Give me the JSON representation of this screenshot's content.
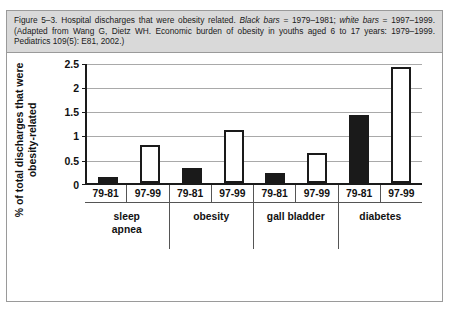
{
  "caption": {
    "part1": "Figure 5–3. Hospital discharges that were obesity related. ",
    "italic1": "Black bars",
    "part2": " = 1979–1981; ",
    "italic2": "white bars",
    "part3": " = 1997–1999. (Adapted from Wang G, Dietz WH. Economic burden of obesity in youths aged 6 to 17 years: 1979–1999. Pediatrics 109(5): E81, 2002.)"
  },
  "chart_data": {
    "type": "bar",
    "title": "",
    "xlabel": "",
    "ylabel": "% of total discharges that were obesity-related",
    "ylabel_lines": [
      "% of total discharges that were",
      "obesity-related"
    ],
    "ylim": [
      0,
      2.5
    ],
    "yticks": [
      0,
      0.5,
      1,
      1.5,
      2,
      2.5
    ],
    "ytick_labels": [
      "0",
      "0.5",
      "1",
      "1.5",
      "2",
      "2.5"
    ],
    "grid": true,
    "legend": null,
    "categories": [
      "sleep apnea",
      "obesity",
      "gall bladder",
      "diabetes"
    ],
    "category_labels": [
      [
        "sleep",
        "apnea"
      ],
      [
        "obesity"
      ],
      [
        "gall bladder"
      ],
      [
        "diabetes"
      ]
    ],
    "period_labels": [
      "79-81",
      "97-99",
      "79-81",
      "97-99",
      "79-81",
      "97-99",
      "79-81",
      "97-99"
    ],
    "series": [
      {
        "name": "1979-1981",
        "style": "black",
        "values": [
          0.13,
          0.3,
          0.2,
          1.41
        ]
      },
      {
        "name": "1997-1999",
        "style": "white",
        "values": [
          0.79,
          1.1,
          0.62,
          2.39
        ]
      }
    ],
    "bars": [
      {
        "category": "sleep apnea",
        "period": "79-81",
        "value": 0.13,
        "style": "black"
      },
      {
        "category": "sleep apnea",
        "period": "97-99",
        "value": 0.79,
        "style": "white"
      },
      {
        "category": "obesity",
        "period": "79-81",
        "value": 0.3,
        "style": "black"
      },
      {
        "category": "obesity",
        "period": "97-99",
        "value": 1.1,
        "style": "white"
      },
      {
        "category": "gall bladder",
        "period": "79-81",
        "value": 0.2,
        "style": "black"
      },
      {
        "category": "gall bladder",
        "period": "97-99",
        "value": 0.62,
        "style": "white"
      },
      {
        "category": "diabetes",
        "period": "79-81",
        "value": 1.41,
        "style": "black"
      },
      {
        "category": "diabetes",
        "period": "97-99",
        "value": 2.39,
        "style": "white"
      }
    ],
    "colors": {
      "bar_black": "#1a1a1a",
      "bar_white": "#ffffff",
      "bar_outline": "#1a1a1a",
      "gridline": "#a9a9a9",
      "axis": "#1a1a1a",
      "caption_background": "#d9d9d9",
      "plot_background": "#ffffff"
    }
  }
}
